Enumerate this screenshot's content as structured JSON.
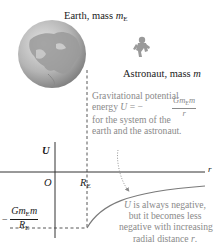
{
  "diagram": {
    "earth_label": {
      "prefix": "Earth, mass ",
      "symbol": "m",
      "subscript": "E"
    },
    "astronaut_label": {
      "prefix": "Astronaut, mass ",
      "symbol": "m"
    },
    "axes": {
      "y_label": "U",
      "x_label": "r",
      "origin_label": "O",
      "radius_tick": {
        "symbol": "R",
        "subscript": "E"
      }
    },
    "min_value_label": {
      "sign": "−",
      "numerator": {
        "G": "G",
        "m1": "m",
        "m1_sub": "E",
        "m2": "m"
      },
      "denominator": {
        "symbol": "R",
        "subscript": "E"
      }
    },
    "annotation_formula": {
      "line1": "Gravitational potential",
      "line2_prefix": "energy ",
      "line2_var": "U",
      "line2_eq": " = −",
      "numerator": {
        "G": "G",
        "m1": "m",
        "m1_sub": "E",
        "m2": "m"
      },
      "denominator": "r",
      "line3": "for the system of the",
      "line4": "earth and the astronaut."
    },
    "annotation_negative": {
      "line1_var": "U",
      "line1_rest": " is always negative,",
      "line2": "but it becomes less",
      "line3": "negative with increasing",
      "line4_prefix": "radial distance ",
      "line4_var": "r",
      "line4_suffix": "."
    },
    "icons": [
      "earth-globe-icon",
      "astronaut-icon"
    ],
    "colors": {
      "axis": "#333333",
      "curve": "#7a7a7a",
      "annotation_text": "#8a8a8a",
      "globe_fill": "#b9b9b9",
      "globe_land": "#8e8e8e"
    }
  }
}
